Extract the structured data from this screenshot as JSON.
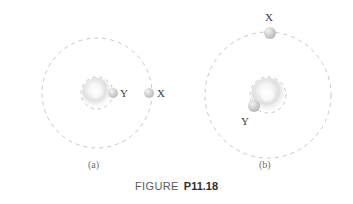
{
  "figure": {
    "caption_word": "FIGURE",
    "caption_number": "P11.18",
    "panels": [
      {
        "id": "a",
        "label": "(a)",
        "label_x": 88,
        "label_y": 160,
        "center_x": 97,
        "center_y": 93,
        "outer_orbit_radius": 55,
        "inner_orbit_radius": 16,
        "central_body_radius": 15,
        "central_core_radius": 6,
        "bodies": [
          {
            "name": "Y",
            "label": "Y",
            "x": 113,
            "y": 93,
            "radius": 5,
            "label_x": 120,
            "label_y": 88
          },
          {
            "name": "X",
            "label": "X",
            "x": 149,
            "y": 93,
            "radius": 5,
            "label_x": 157,
            "label_y": 88
          }
        ]
      },
      {
        "id": "b",
        "label": "(b)",
        "label_x": 259,
        "label_y": 160,
        "center_x": 268,
        "center_y": 95,
        "outer_orbit_radius": 63,
        "inner_orbit_radius": 18,
        "central_body_radius": 17,
        "central_core_radius": 7,
        "bodies": [
          {
            "name": "X",
            "label": "X",
            "x": 270,
            "y": 33,
            "radius": 6,
            "label_x": 265,
            "label_y": 12
          },
          {
            "name": "Y",
            "label": "Y",
            "x": 254,
            "y": 106,
            "radius": 6,
            "label_x": 241,
            "label_y": 116
          }
        ]
      }
    ],
    "colors": {
      "orbit_line": "#c9c5cf",
      "body_fill": "#c8c8c8",
      "body_highlight": "#f2f2f2",
      "central_glow": "#d5d5d5",
      "central_core": "#fcfcfc",
      "label_text": "#3a3a3a",
      "panel_label_text": "#6f6f6f",
      "caption_text": "#2f2f2f",
      "background": "#ffffff"
    },
    "orbit_dash": "4 4",
    "orbit_stroke_width": 1
  }
}
